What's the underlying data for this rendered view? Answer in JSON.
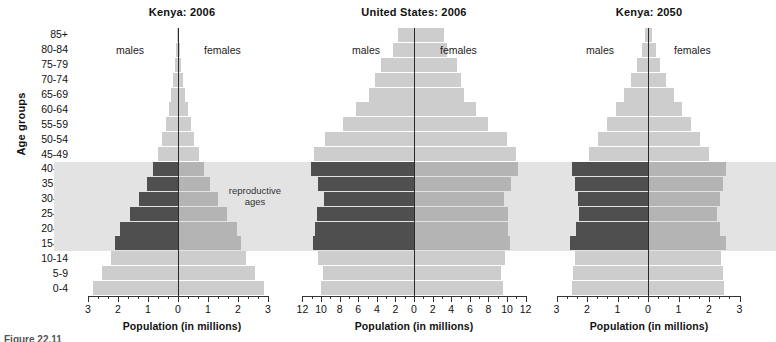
{
  "figure": {
    "axis_title_y": "Age groups",
    "caption": "Figure 22.11",
    "male_label": "males",
    "female_label": "females",
    "repro_note_line1": "reproductive",
    "repro_note_line2": "ages",
    "colors": {
      "light": "#cdcdcd",
      "mid": "#b4b4b4",
      "dark": "#4f4f4f",
      "band": "#e3e3e3",
      "axis": "#333333",
      "center": "#2a2a2a",
      "background": "#ffffff"
    }
  },
  "age_groups": [
    "85+",
    "80-84",
    "75-79",
    "70-74",
    "65-69",
    "60-64",
    "55-59",
    "50-54",
    "45-49",
    "40-44",
    "35 39",
    "30-34",
    "25-29",
    "20-24",
    "15-19",
    "10-14",
    "5-9",
    "0-4"
  ],
  "chart_data": [
    {
      "type": "bar",
      "subtype": "population-pyramid",
      "title": "Kenya:  2006",
      "xlabel": "Population (in millions)",
      "ylabel": "Age groups",
      "categories": [
        "85+",
        "80-84",
        "75-79",
        "70-74",
        "65-69",
        "60-64",
        "55-59",
        "50-54",
        "45-49",
        "40-44",
        "35 39",
        "30-34",
        "25-29",
        "20-24",
        "15-19",
        "10-14",
        "5-9",
        "0-4"
      ],
      "series": [
        {
          "name": "males",
          "values": [
            0.03,
            0.06,
            0.1,
            0.16,
            0.23,
            0.31,
            0.4,
            0.52,
            0.68,
            0.85,
            1.05,
            1.3,
            1.6,
            1.95,
            2.1,
            2.25,
            2.55,
            2.85
          ]
        },
        {
          "name": "females",
          "values": [
            0.04,
            0.07,
            0.11,
            0.17,
            0.24,
            0.32,
            0.42,
            0.54,
            0.7,
            0.88,
            1.08,
            1.33,
            1.62,
            1.95,
            2.1,
            2.25,
            2.55,
            2.85
          ]
        }
      ],
      "xticks": [
        3,
        2,
        1,
        0,
        1,
        2,
        3
      ],
      "xlim": [
        3,
        3
      ],
      "minor_ticks_per_interval": 2,
      "grid": false,
      "legend": "inline",
      "reproductive_ages": [
        "15-19",
        "20-24",
        "25-29",
        "30-34",
        "35 39",
        "40-44"
      ]
    },
    {
      "type": "bar",
      "subtype": "population-pyramid",
      "title": "United States:  2006",
      "xlabel": "Population (in millions)",
      "ylabel": "Age groups",
      "categories": [
        "85+",
        "80-84",
        "75-79",
        "70-74",
        "65-69",
        "60-64",
        "55-59",
        "50-54",
        "45-49",
        "40-44",
        "35 39",
        "30-34",
        "25-29",
        "20-24",
        "15-19",
        "10-14",
        "5-9",
        "0-4"
      ],
      "series": [
        {
          "name": "males",
          "values": [
            1.7,
            2.3,
            3.5,
            4.2,
            4.8,
            6.2,
            7.6,
            9.6,
            10.8,
            11.1,
            10.3,
            9.7,
            10.4,
            10.6,
            10.9,
            10.3,
            9.8,
            10.0
          ]
        },
        {
          "name": "females",
          "values": [
            3.2,
            3.6,
            4.6,
            5.1,
            5.4,
            6.7,
            8.0,
            10.0,
            11.0,
            11.2,
            10.4,
            9.7,
            10.1,
            10.1,
            10.3,
            9.8,
            9.4,
            9.6
          ]
        }
      ],
      "xticks": [
        12,
        10,
        8,
        6,
        4,
        2,
        0,
        2,
        4,
        6,
        8,
        10,
        12
      ],
      "xlim": [
        12,
        12
      ],
      "minor_ticks_per_interval": 1,
      "grid": false,
      "legend": "inline",
      "reproductive_ages": [
        "15-19",
        "20-24",
        "25-29",
        "30-34",
        "35 39",
        "40-44"
      ]
    },
    {
      "type": "bar",
      "subtype": "population-pyramid",
      "title": "Kenya:  2050",
      "xlabel": "Population (in millions)",
      "ylabel": "Age groups",
      "categories": [
        "85+",
        "80-84",
        "75-79",
        "70-74",
        "65-69",
        "60-64",
        "55-59",
        "50-54",
        "45-49",
        "40-44",
        "35 39",
        "30-34",
        "25-29",
        "20-24",
        "15-19",
        "10-14",
        "5-9",
        "0-4"
      ],
      "series": [
        {
          "name": "males",
          "values": [
            0.1,
            0.2,
            0.35,
            0.55,
            0.8,
            1.05,
            1.35,
            1.65,
            1.95,
            2.5,
            2.4,
            2.3,
            2.25,
            2.35,
            2.55,
            2.4,
            2.45,
            2.5
          ]
        },
        {
          "name": "females",
          "values": [
            0.14,
            0.25,
            0.4,
            0.6,
            0.85,
            1.1,
            1.4,
            1.7,
            2.0,
            2.55,
            2.45,
            2.35,
            2.25,
            2.35,
            2.55,
            2.4,
            2.45,
            2.5
          ]
        }
      ],
      "xticks": [
        3,
        2,
        1,
        0,
        1,
        2,
        3
      ],
      "xlim": [
        3,
        3
      ],
      "minor_ticks_per_interval": 2,
      "grid": false,
      "legend": "inline",
      "reproductive_ages": [
        "15-19",
        "20-24",
        "25-29",
        "30-34",
        "35 39",
        "40-44"
      ]
    }
  ]
}
